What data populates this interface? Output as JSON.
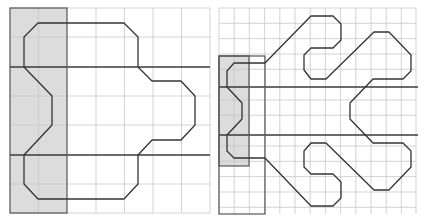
{
  "figure": {
    "panels": [
      {
        "id": "left",
        "description": "Original shape on a 7x7 grid with shaded left strip",
        "grid": {
          "x": 10,
          "y": 8,
          "cols": 7,
          "rows": 7,
          "cell_w": 28.57,
          "cell_h": 29.3
        },
        "shaded_strip": {
          "col_start": 0,
          "col_end": 2
        },
        "bold_rows": [
          2,
          5
        ],
        "colors": {
          "grid": "#c8c8c8",
          "shade": "#dcdcdc",
          "outline": "#333333"
        }
      },
      {
        "id": "right",
        "description": "Transformed shape on a finer 13-column grid with shaded strip and framed region",
        "grid": {
          "x": 219,
          "y": 8,
          "cols": 13,
          "rows": 13.5,
          "cell": 15.2
        },
        "shaded_strip": {
          "col_start": 0,
          "col_end": 2,
          "row_start": 3,
          "row_end": 10.2
        },
        "frame": {
          "col_start": 0,
          "col_end": 3,
          "row_start": 3,
          "row_end": 13.5
        },
        "bold_rows": [
          5.1,
          8.2
        ],
        "colors": {
          "grid": "#c8c8c8",
          "shade": "#dcdcdc",
          "outline": "#333333"
        }
      }
    ]
  }
}
